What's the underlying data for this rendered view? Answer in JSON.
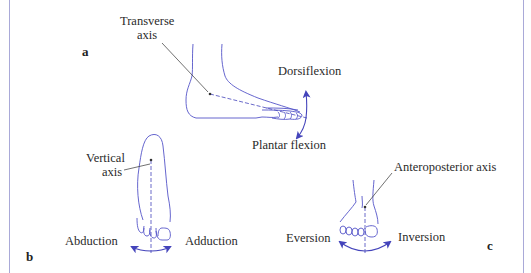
{
  "figure": {
    "colors": {
      "outline": "#5555c8",
      "arrow": "#4444bb",
      "leader": "#333333",
      "frame": "#a9a9d8",
      "text": "#2a2a2a"
    },
    "panels": [
      {
        "letter": "a",
        "axis_label_line1": "Transverse",
        "axis_label_line2": "axis",
        "motion_up": "Dorsiflexion",
        "motion_down": "Plantar flexion"
      },
      {
        "letter": "b",
        "axis_label_line1": "Vertical",
        "axis_label_line2": "axis",
        "motion_left": "Abduction",
        "motion_right": "Adduction"
      },
      {
        "letter": "c",
        "axis_label": "Anteroposterior axis",
        "motion_left": "Eversion",
        "motion_right": "Inversion"
      }
    ]
  }
}
